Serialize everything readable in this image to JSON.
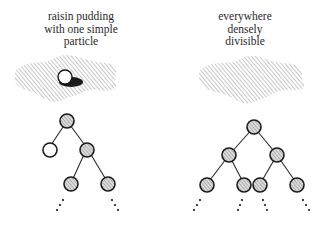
{
  "left_panel": {
    "caption_lines": [
      "raisin pudding",
      "with one simple",
      "particle"
    ],
    "blob": "hatched-pudding",
    "particle": "white-sphere-with-shadow",
    "tree": {
      "root": "hatched",
      "children": [
        {
          "type": "white-leaf"
        },
        {
          "type": "hatched",
          "children": [
            {
              "type": "hatched",
              "continues": true
            },
            {
              "type": "hatched",
              "continues": true
            }
          ]
        }
      ]
    }
  },
  "right_panel": {
    "caption_lines": [
      "everywhere",
      "densely",
      "divisible"
    ],
    "blob": "hatched-pudding",
    "tree": {
      "root": "hatched",
      "levels": 3,
      "leaves_continue": true
    }
  },
  "colors": {
    "ink": "#222222",
    "hatch": "#9a9a9a",
    "background": "#ffffff"
  }
}
